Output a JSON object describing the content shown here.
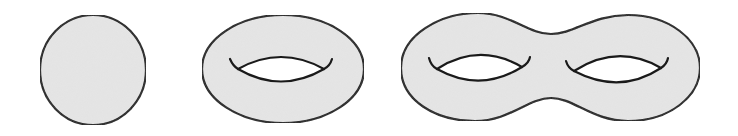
{
  "figure": {
    "colors": {
      "fill": "#e6e6e6",
      "stroke": "#1a1a1a",
      "hole": "#ffffff"
    },
    "surfaces": [
      {
        "name": "sphere",
        "genus": 0
      },
      {
        "name": "torus",
        "genus": 1
      },
      {
        "name": "double-torus",
        "genus": 2
      }
    ]
  }
}
